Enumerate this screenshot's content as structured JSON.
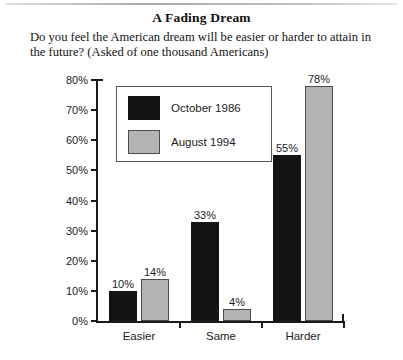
{
  "figure": {
    "title": "A Fading Dream",
    "subtitle": "Do you feel the American dream will be easier or harder to attain in the future? (Asked of one thousand Americans)"
  },
  "chart_data": {
    "type": "bar",
    "title": "A Fading Dream",
    "subtitle": "Do you feel the American dream will be easier or harder to attain in the future? (Asked of one thousand Americans)",
    "categories": [
      "Easier",
      "Same",
      "Harder"
    ],
    "series": [
      {
        "name": "October 1986",
        "color": "#141414",
        "values": [
          10,
          33,
          55
        ],
        "labels": [
          "10%",
          "33%",
          "55%"
        ]
      },
      {
        "name": "August 1994",
        "color": "#b3b3b3",
        "values": [
          14,
          4,
          78
        ],
        "labels": [
          "14%",
          "4%",
          "78%"
        ]
      }
    ],
    "xlabel": "",
    "ylabel": "",
    "ylim": [
      0,
      80
    ],
    "ytick_values": [
      0,
      10,
      20,
      30,
      40,
      50,
      60,
      70,
      80
    ],
    "ytick_labels": [
      "0%",
      "10%",
      "20%",
      "30%",
      "40%",
      "50%",
      "60%",
      "70%",
      "80%"
    ],
    "grid": false,
    "legend_position": "upper-left-inside",
    "value_labels_shown": true
  }
}
